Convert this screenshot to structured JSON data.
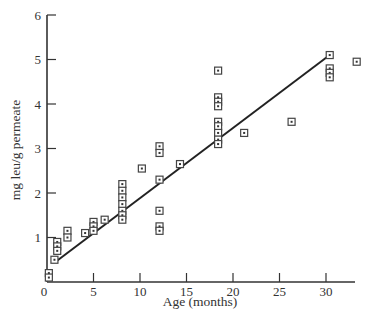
{
  "chart_data": {
    "type": "scatter",
    "title": "",
    "xlabel": "Age (months)",
    "ylabel": "mg leu/g permeate",
    "xlim": [
      0,
      34
    ],
    "ylim": [
      0,
      6
    ],
    "x_ticks": [
      0,
      5,
      10,
      15,
      20,
      25,
      30
    ],
    "y_ticks": [
      1,
      2,
      3,
      4,
      5,
      6
    ],
    "grid": false,
    "legend": null,
    "marker": "square-with-dot",
    "series": [
      {
        "name": "observations",
        "points": [
          {
            "x": 0.2,
            "y": 0.2
          },
          {
            "x": 0.2,
            "y": 0.1
          },
          {
            "x": 0.8,
            "y": 0.5
          },
          {
            "x": 1.1,
            "y": 0.9
          },
          {
            "x": 1.1,
            "y": 0.8
          },
          {
            "x": 1.1,
            "y": 0.7
          },
          {
            "x": 2.2,
            "y": 1.15
          },
          {
            "x": 2.2,
            "y": 1.0
          },
          {
            "x": 4.1,
            "y": 1.1
          },
          {
            "x": 5.0,
            "y": 1.35
          },
          {
            "x": 5.0,
            "y": 1.25
          },
          {
            "x": 5.0,
            "y": 1.15
          },
          {
            "x": 6.2,
            "y": 1.4
          },
          {
            "x": 8.1,
            "y": 2.2
          },
          {
            "x": 8.1,
            "y": 2.05
          },
          {
            "x": 8.1,
            "y": 1.9
          },
          {
            "x": 8.1,
            "y": 1.75
          },
          {
            "x": 8.1,
            "y": 1.6
          },
          {
            "x": 8.1,
            "y": 1.5
          },
          {
            "x": 8.1,
            "y": 1.4
          },
          {
            "x": 10.2,
            "y": 2.55
          },
          {
            "x": 12.1,
            "y": 3.05
          },
          {
            "x": 12.1,
            "y": 2.9
          },
          {
            "x": 12.1,
            "y": 2.3
          },
          {
            "x": 12.1,
            "y": 1.6
          },
          {
            "x": 12.1,
            "y": 1.25
          },
          {
            "x": 12.1,
            "y": 1.15
          },
          {
            "x": 14.3,
            "y": 2.65
          },
          {
            "x": 18.4,
            "y": 4.75
          },
          {
            "x": 18.4,
            "y": 4.15
          },
          {
            "x": 18.4,
            "y": 4.05
          },
          {
            "x": 18.4,
            "y": 3.95
          },
          {
            "x": 18.4,
            "y": 3.6
          },
          {
            "x": 18.4,
            "y": 3.5
          },
          {
            "x": 18.4,
            "y": 3.35
          },
          {
            "x": 18.4,
            "y": 3.2
          },
          {
            "x": 18.4,
            "y": 3.1
          },
          {
            "x": 21.2,
            "y": 3.35
          },
          {
            "x": 26.3,
            "y": 3.6
          },
          {
            "x": 30.4,
            "y": 5.1
          },
          {
            "x": 30.4,
            "y": 4.8
          },
          {
            "x": 30.4,
            "y": 4.7
          },
          {
            "x": 30.4,
            "y": 4.6
          },
          {
            "x": 33.3,
            "y": 4.95
          }
        ]
      }
    ],
    "fit_line": {
      "type": "linear",
      "x": [
        0.9,
        30.4
      ],
      "y": [
        0.45,
        5.1
      ]
    }
  }
}
